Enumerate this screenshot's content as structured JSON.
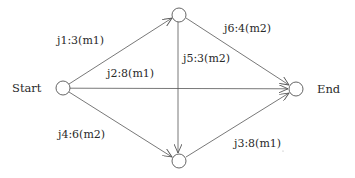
{
  "diagram": {
    "type": "directed-graph",
    "nodes": [
      {
        "id": "start",
        "label": "Start"
      },
      {
        "id": "top",
        "label": ""
      },
      {
        "id": "bottom",
        "label": ""
      },
      {
        "id": "end",
        "label": "End"
      }
    ],
    "edges": [
      {
        "from": "start",
        "to": "top",
        "label": "j1:3(m1)"
      },
      {
        "from": "start",
        "to": "end",
        "label": "j2:8(m1)"
      },
      {
        "from": "bottom",
        "to": "end",
        "label": "j3:8(m1)"
      },
      {
        "from": "start",
        "to": "bottom",
        "label": "j4:6(m2)"
      },
      {
        "from": "top",
        "to": "bottom",
        "label": "j5:3(m2)"
      },
      {
        "from": "top",
        "to": "end",
        "label": "j6:4(m2)"
      }
    ],
    "colors": {
      "line": "#555555",
      "text": "#2a2a2a",
      "background": "#ffffff"
    }
  }
}
